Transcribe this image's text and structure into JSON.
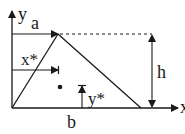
{
  "diagram": {
    "title_clipped": "",
    "axes": {
      "x_label": "x",
      "y_label": "y"
    },
    "dimensions": {
      "a": "a",
      "b": "b",
      "h": "h",
      "x_star": "x*",
      "y_star": "y*"
    },
    "shape": "triangle",
    "centroid_marker": "dot",
    "colors": {
      "stroke": "#1a1a1a",
      "background": "#ffffff"
    }
  }
}
